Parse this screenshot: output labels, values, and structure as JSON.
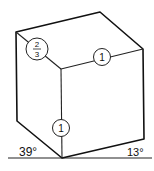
{
  "diagram": {
    "type": "two-point perspective cube",
    "labels": {
      "left_edge_ratio_top": "2",
      "left_edge_ratio_bottom": "3",
      "right_edge_ratio": "1",
      "vertical_edge_ratio": "1",
      "left_angle": "39°",
      "right_angle": "13°"
    },
    "colors": {
      "line": "#111111",
      "background": "#ffffff"
    }
  }
}
